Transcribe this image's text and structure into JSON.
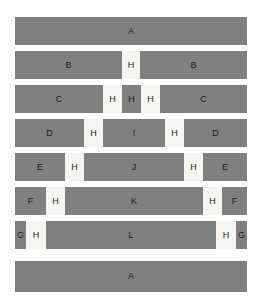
{
  "figure": {
    "background_color": "#ffffff",
    "dark_color": "#808080",
    "light_color": "#f5f5f2",
    "text_color": "#1c1c1c",
    "canvas": {
      "width": 261,
      "height": 306
    },
    "bar_left": 15,
    "bar_width": 232
  },
  "chart_data": {
    "type": "bar",
    "orientation": "horizontal",
    "title": "",
    "xlabel": "",
    "ylabel": "",
    "grid": false,
    "legend": "none",
    "xlim": [
      0,
      232
    ],
    "stacking": "normalized-segments",
    "palette": {
      "dark": "#808080",
      "light": "#f5f5f2"
    },
    "row_height": 28,
    "row_gap": 6,
    "categories": [
      "row-1",
      "row-2",
      "row-3",
      "row-4",
      "row-5",
      "row-6",
      "row-7",
      "row-8"
    ],
    "rows": [
      {
        "index": 1,
        "top": 17,
        "height": 28,
        "segments": [
          {
            "label": "A",
            "width": 232,
            "shade": "dark"
          }
        ]
      },
      {
        "index": 2,
        "top": 51,
        "height": 28,
        "segments": [
          {
            "label": "B",
            "width": 107,
            "shade": "dark"
          },
          {
            "label": "H",
            "width": 18,
            "shade": "light"
          },
          {
            "label": "B",
            "width": 107,
            "shade": "dark"
          }
        ]
      },
      {
        "index": 3,
        "top": 85,
        "height": 28,
        "segments": [
          {
            "label": "C",
            "width": 88,
            "shade": "dark"
          },
          {
            "label": "H",
            "width": 19,
            "shade": "light"
          },
          {
            "label": "H",
            "width": 19,
            "shade": "dark"
          },
          {
            "label": "H",
            "width": 19,
            "shade": "light"
          },
          {
            "label": "C",
            "width": 87,
            "shade": "dark"
          }
        ]
      },
      {
        "index": 4,
        "top": 119,
        "height": 28,
        "segments": [
          {
            "label": "D",
            "width": 69,
            "shade": "dark"
          },
          {
            "label": "H",
            "width": 19,
            "shade": "light"
          },
          {
            "label": "I",
            "width": 62,
            "shade": "dark"
          },
          {
            "label": "H",
            "width": 19,
            "shade": "light"
          },
          {
            "label": "D",
            "width": 63,
            "shade": "dark"
          }
        ]
      },
      {
        "index": 5,
        "top": 153,
        "height": 28,
        "segments": [
          {
            "label": "E",
            "width": 50,
            "shade": "dark"
          },
          {
            "label": "H",
            "width": 19,
            "shade": "light"
          },
          {
            "label": "J",
            "width": 100,
            "shade": "dark"
          },
          {
            "label": "H",
            "width": 19,
            "shade": "light"
          },
          {
            "label": "E",
            "width": 44,
            "shade": "dark"
          }
        ]
      },
      {
        "index": 6,
        "top": 187,
        "height": 28,
        "segments": [
          {
            "label": "F",
            "width": 31,
            "shade": "dark"
          },
          {
            "label": "H",
            "width": 19,
            "shade": "light"
          },
          {
            "label": "K",
            "width": 138,
            "shade": "dark"
          },
          {
            "label": "H",
            "width": 19,
            "shade": "light"
          },
          {
            "label": "F",
            "width": 25,
            "shade": "dark"
          }
        ]
      },
      {
        "index": 7,
        "top": 221,
        "height": 28,
        "segments": [
          {
            "label": "G",
            "width": 11,
            "shade": "dark"
          },
          {
            "label": "H",
            "width": 20,
            "shade": "light"
          },
          {
            "label": "L",
            "width": 170,
            "shade": "dark"
          },
          {
            "label": "H",
            "width": 20,
            "shade": "light"
          },
          {
            "label": "G",
            "width": 11,
            "shade": "dark"
          }
        ]
      },
      {
        "index": 8,
        "top": 261,
        "height": 31,
        "segments": [
          {
            "label": "A",
            "width": 232,
            "shade": "dark"
          }
        ]
      }
    ]
  }
}
